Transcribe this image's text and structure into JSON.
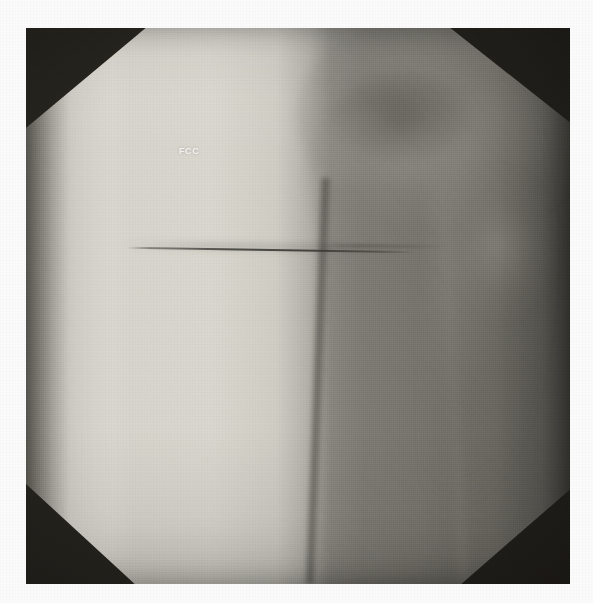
{
  "image": {
    "modality": "radiograph",
    "view_description": "anteroposterior radiograph of the proximal femur and hip",
    "field_shape": "octagonal",
    "background_color": "#fbfbfb",
    "plate_color": "#14140f",
    "width": 593,
    "height": 603
  },
  "overlay": {
    "marker_text": "FCC",
    "marker_color": "#f2f2ee"
  },
  "anatomy": {
    "femoral_head_label": "femoral-head",
    "femoral_neck_label": "femoral-neck",
    "greater_trochanter_label": "greater-trochanter",
    "femoral_shaft_label": "femoral-shaft",
    "soft_tissue_label": "soft-tissue-column",
    "lateral_soft_tissue_label": "lateral-soft-tissue"
  },
  "hardware": {
    "guidewire_label": "guidewire",
    "fracture_line_label": "cortical-fracture-line"
  },
  "palette": {
    "soft_tissue_bright": "#d9d7ce",
    "soft_tissue_mid": "#8e8c85",
    "bone_mid": "#76746d",
    "dark_field": "#24221d",
    "plate_black": "#101010",
    "margin_white": "#fbfbfb"
  }
}
